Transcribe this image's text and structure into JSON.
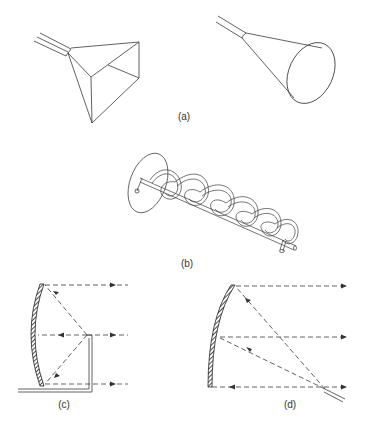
{
  "figure": {
    "panels": [
      {
        "id": "a",
        "label": "(a)",
        "description": "Pyramidal horn antenna and conical horn antenna",
        "items": [
          "pyramidal-horn",
          "conical-horn"
        ]
      },
      {
        "id": "b",
        "label": "(b)",
        "description": "Helical antenna with ground plane",
        "items": [
          "helix-antenna"
        ]
      },
      {
        "id": "c",
        "label": "(c)",
        "description": "Front-fed parabolic reflector with bent feed",
        "items": [
          "reflector",
          "feed-pipe",
          "dashed-rays"
        ]
      },
      {
        "id": "d",
        "label": "(d)",
        "description": "Offset-fed parabolic reflector",
        "items": [
          "reflector",
          "offset-feed",
          "dashed-rays"
        ]
      }
    ]
  },
  "colors": {
    "line": "#3a3a3a",
    "background": "#ffffff",
    "label": "#333333"
  }
}
